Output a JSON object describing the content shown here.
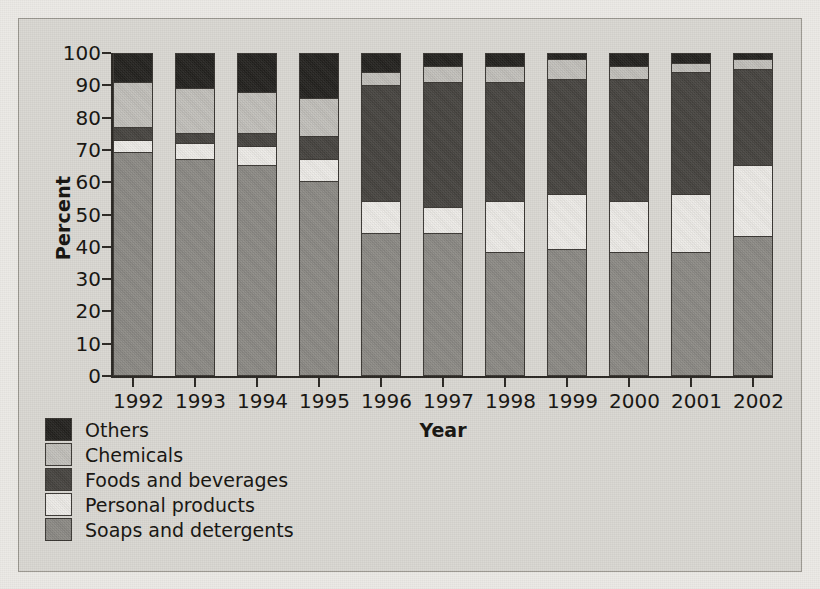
{
  "chart_data": {
    "type": "bar",
    "subtype": "stacked-percentage",
    "title": "",
    "xlabel": "Year",
    "ylabel": "Percent",
    "ylim": [
      0,
      100
    ],
    "yticks": [
      0,
      10,
      20,
      30,
      40,
      50,
      60,
      70,
      80,
      90,
      100
    ],
    "ytick_labels": [
      "0",
      "10",
      "20",
      "30",
      "40",
      "50",
      "60",
      "70",
      "80",
      "90",
      "100"
    ],
    "grid": false,
    "legend_position": "below-left",
    "categories": [
      "1992",
      "1993",
      "1994",
      "1995",
      "1996",
      "1997",
      "1998",
      "1999",
      "2000",
      "2001",
      "2002"
    ],
    "stack_order_bottom_to_top": [
      "Soaps and detergents",
      "Personal products",
      "Foods and beverages",
      "Chemicals",
      "Others"
    ],
    "series": [
      {
        "name": "Soaps and detergents",
        "color": "#8c8a85",
        "values": [
          69,
          67,
          65,
          60,
          44,
          44,
          38,
          39,
          38,
          38,
          43
        ]
      },
      {
        "name": "Personal products",
        "color": "#eeece8",
        "values": [
          4,
          5,
          6,
          7,
          10,
          8,
          16,
          17,
          16,
          18,
          22
        ]
      },
      {
        "name": "Foods and beverages",
        "color": "#46433f",
        "values": [
          4,
          3,
          4,
          7,
          36,
          39,
          37,
          36,
          38,
          38,
          30
        ]
      },
      {
        "name": "Chemicals",
        "color": "#c2c0bb",
        "values": [
          14,
          14,
          13,
          12,
          4,
          5,
          5,
          6,
          4,
          3,
          3
        ]
      },
      {
        "name": "Others",
        "color": "#23211e",
        "values": [
          9,
          11,
          12,
          14,
          6,
          4,
          4,
          2,
          4,
          3,
          2
        ]
      }
    ],
    "legend_entries": [
      {
        "label": "Others",
        "color": "#23211e"
      },
      {
        "label": "Chemicals",
        "color": "#c2c0bb"
      },
      {
        "label": "Foods and beverages",
        "color": "#46433f"
      },
      {
        "label": "Personal products",
        "color": "#eeece8"
      },
      {
        "label": "Soaps and detergents",
        "color": "#8c8a85"
      }
    ]
  }
}
